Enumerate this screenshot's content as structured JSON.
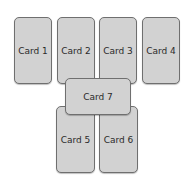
{
  "cards": [
    {
      "label": "Card 1"
    },
    {
      "label": "Card 2"
    },
    {
      "label": "Card 3"
    },
    {
      "label": "Card 4"
    },
    {
      "label": "Card 5"
    },
    {
      "label": "Card 6"
    },
    {
      "label": "Card 7"
    }
  ],
  "colors": {
    "card_fill": "#d2d2d2",
    "card_border": "#6f6f6f",
    "background": "#ffffff"
  }
}
